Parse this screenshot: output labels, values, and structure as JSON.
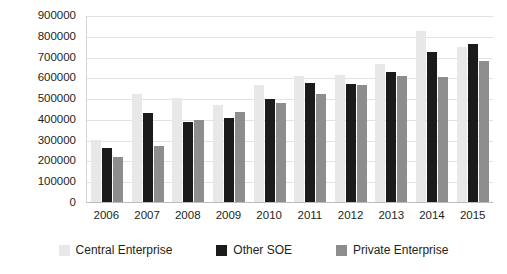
{
  "chart_data": {
    "type": "bar",
    "title": "",
    "subtitle": "",
    "xlabel": "",
    "ylabel": "",
    "ylim": [
      0,
      900000
    ],
    "ytick_step": 100000,
    "yticks": [
      "900000",
      "800000",
      "700000",
      "600000",
      "500000",
      "400000",
      "300000",
      "200000",
      "100000",
      "0"
    ],
    "categories": [
      "2006",
      "2007",
      "2008",
      "2009",
      "2010",
      "2011",
      "2012",
      "2013",
      "2014",
      "2015"
    ],
    "grid": true,
    "legend_position": "bottom",
    "series": [
      {
        "name": "Central Enterprise",
        "color": "#e8e8e8",
        "values": [
          300000,
          520000,
          500000,
          465000,
          565000,
          605000,
          610000,
          665000,
          825000,
          745000
        ]
      },
      {
        "name": "Other SOE",
        "color": "#1b1b1b",
        "values": [
          260000,
          430000,
          385000,
          405000,
          495000,
          575000,
          570000,
          625000,
          720000,
          760000
        ]
      },
      {
        "name": "Private Enterprise",
        "color": "#8d8d8d",
        "values": [
          218000,
          270000,
          395000,
          435000,
          475000,
          520000,
          565000,
          605000,
          600000,
          680000
        ]
      }
    ]
  }
}
